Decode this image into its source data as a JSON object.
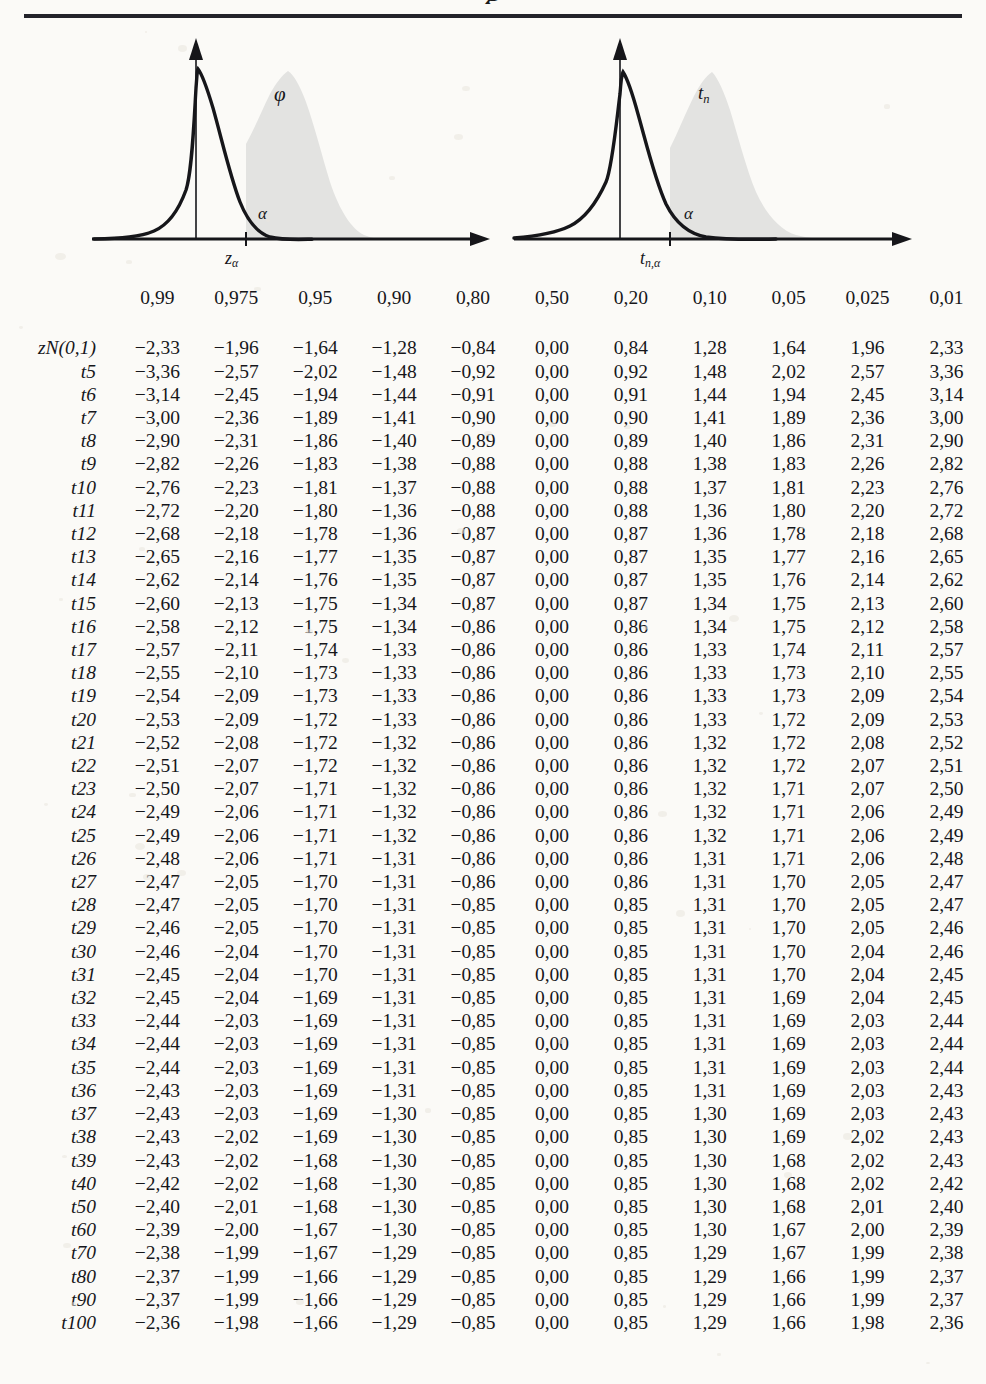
{
  "document": {
    "title_fragment": "g",
    "figures": [
      {
        "name": "standard-normal-density",
        "curve_label": "φ",
        "area_label": "α",
        "x_mark_base": "z",
        "x_mark_sub": "α"
      },
      {
        "name": "t-distribution-density",
        "curve_label_base": "t",
        "curve_label_sub": "n",
        "area_label": "α",
        "x_mark_base": "t",
        "x_mark_sub": "n,α"
      }
    ]
  },
  "chart_data": {
    "type": "table",
    "row_header_label": "",
    "columns": [
      "0,99",
      "0,975",
      "0,95",
      "0,90",
      "0,80",
      "0,50",
      "0,20",
      "0,10",
      "0,05",
      "0,025",
      "0,01"
    ],
    "rows": [
      {
        "base": "z",
        "sub": "N(0,1)",
        "calligraphic": true,
        "values": [
          "−2,33",
          "−1,96",
          "−1,64",
          "−1,28",
          "−0,84",
          "0,00",
          "0,84",
          "1,28",
          "1,64",
          "1,96",
          "2,33"
        ]
      },
      {
        "base": "t",
        "sub": "5",
        "values": [
          "−3,36",
          "−2,57",
          "−2,02",
          "−1,48",
          "−0,92",
          "0,00",
          "0,92",
          "1,48",
          "2,02",
          "2,57",
          "3,36"
        ]
      },
      {
        "base": "t",
        "sub": "6",
        "values": [
          "−3,14",
          "−2,45",
          "−1,94",
          "−1,44",
          "−0,91",
          "0,00",
          "0,91",
          "1,44",
          "1,94",
          "2,45",
          "3,14"
        ]
      },
      {
        "base": "t",
        "sub": "7",
        "values": [
          "−3,00",
          "−2,36",
          "−1,89",
          "−1,41",
          "−0,90",
          "0,00",
          "0,90",
          "1,41",
          "1,89",
          "2,36",
          "3,00"
        ]
      },
      {
        "base": "t",
        "sub": "8",
        "values": [
          "−2,90",
          "−2,31",
          "−1,86",
          "−1,40",
          "−0,89",
          "0,00",
          "0,89",
          "1,40",
          "1,86",
          "2,31",
          "2,90"
        ]
      },
      {
        "base": "t",
        "sub": "9",
        "values": [
          "−2,82",
          "−2,26",
          "−1,83",
          "−1,38",
          "−0,88",
          "0,00",
          "0,88",
          "1,38",
          "1,83",
          "2,26",
          "2,82"
        ]
      },
      {
        "base": "t",
        "sub": "10",
        "values": [
          "−2,76",
          "−2,23",
          "−1,81",
          "−1,37",
          "−0,88",
          "0,00",
          "0,88",
          "1,37",
          "1,81",
          "2,23",
          "2,76"
        ]
      },
      {
        "base": "t",
        "sub": "11",
        "values": [
          "−2,72",
          "−2,20",
          "−1,80",
          "−1,36",
          "−0,88",
          "0,00",
          "0,88",
          "1,36",
          "1,80",
          "2,20",
          "2,72"
        ]
      },
      {
        "base": "t",
        "sub": "12",
        "values": [
          "−2,68",
          "−2,18",
          "−1,78",
          "−1,36",
          "−0,87",
          "0,00",
          "0,87",
          "1,36",
          "1,78",
          "2,18",
          "2,68"
        ]
      },
      {
        "base": "t",
        "sub": "13",
        "values": [
          "−2,65",
          "−2,16",
          "−1,77",
          "−1,35",
          "−0,87",
          "0,00",
          "0,87",
          "1,35",
          "1,77",
          "2,16",
          "2,65"
        ]
      },
      {
        "base": "t",
        "sub": "14",
        "values": [
          "−2,62",
          "−2,14",
          "−1,76",
          "−1,35",
          "−0,87",
          "0,00",
          "0,87",
          "1,35",
          "1,76",
          "2,14",
          "2,62"
        ]
      },
      {
        "base": "t",
        "sub": "15",
        "values": [
          "−2,60",
          "−2,13",
          "−1,75",
          "−1,34",
          "−0,87",
          "0,00",
          "0,87",
          "1,34",
          "1,75",
          "2,13",
          "2,60"
        ]
      },
      {
        "base": "t",
        "sub": "16",
        "values": [
          "−2,58",
          "−2,12",
          "−1,75",
          "−1,34",
          "−0,86",
          "0,00",
          "0,86",
          "1,34",
          "1,75",
          "2,12",
          "2,58"
        ]
      },
      {
        "base": "t",
        "sub": "17",
        "values": [
          "−2,57",
          "−2,11",
          "−1,74",
          "−1,33",
          "−0,86",
          "0,00",
          "0,86",
          "1,33",
          "1,74",
          "2,11",
          "2,57"
        ]
      },
      {
        "base": "t",
        "sub": "18",
        "values": [
          "−2,55",
          "−2,10",
          "−1,73",
          "−1,33",
          "−0,86",
          "0,00",
          "0,86",
          "1,33",
          "1,73",
          "2,10",
          "2,55"
        ]
      },
      {
        "base": "t",
        "sub": "19",
        "values": [
          "−2,54",
          "−2,09",
          "−1,73",
          "−1,33",
          "−0,86",
          "0,00",
          "0,86",
          "1,33",
          "1,73",
          "2,09",
          "2,54"
        ]
      },
      {
        "base": "t",
        "sub": "20",
        "values": [
          "−2,53",
          "−2,09",
          "−1,72",
          "−1,33",
          "−0,86",
          "0,00",
          "0,86",
          "1,33",
          "1,72",
          "2,09",
          "2,53"
        ]
      },
      {
        "base": "t",
        "sub": "21",
        "values": [
          "−2,52",
          "−2,08",
          "−1,72",
          "−1,32",
          "−0,86",
          "0,00",
          "0,86",
          "1,32",
          "1,72",
          "2,08",
          "2,52"
        ]
      },
      {
        "base": "t",
        "sub": "22",
        "values": [
          "−2,51",
          "−2,07",
          "−1,72",
          "−1,32",
          "−0,86",
          "0,00",
          "0,86",
          "1,32",
          "1,72",
          "2,07",
          "2,51"
        ]
      },
      {
        "base": "t",
        "sub": "23",
        "values": [
          "−2,50",
          "−2,07",
          "−1,71",
          "−1,32",
          "−0,86",
          "0,00",
          "0,86",
          "1,32",
          "1,71",
          "2,07",
          "2,50"
        ]
      },
      {
        "base": "t",
        "sub": "24",
        "values": [
          "−2,49",
          "−2,06",
          "−1,71",
          "−1,32",
          "−0,86",
          "0,00",
          "0,86",
          "1,32",
          "1,71",
          "2,06",
          "2,49"
        ]
      },
      {
        "base": "t",
        "sub": "25",
        "values": [
          "−2,49",
          "−2,06",
          "−1,71",
          "−1,32",
          "−0,86",
          "0,00",
          "0,86",
          "1,32",
          "1,71",
          "2,06",
          "2,49"
        ]
      },
      {
        "base": "t",
        "sub": "26",
        "values": [
          "−2,48",
          "−2,06",
          "−1,71",
          "−1,31",
          "−0,86",
          "0,00",
          "0,86",
          "1,31",
          "1,71",
          "2,06",
          "2,48"
        ]
      },
      {
        "base": "t",
        "sub": "27",
        "values": [
          "−2,47",
          "−2,05",
          "−1,70",
          "−1,31",
          "−0,86",
          "0,00",
          "0,86",
          "1,31",
          "1,70",
          "2,05",
          "2,47"
        ]
      },
      {
        "base": "t",
        "sub": "28",
        "values": [
          "−2,47",
          "−2,05",
          "−1,70",
          "−1,31",
          "−0,85",
          "0,00",
          "0,85",
          "1,31",
          "1,70",
          "2,05",
          "2,47"
        ]
      },
      {
        "base": "t",
        "sub": "29",
        "values": [
          "−2,46",
          "−2,05",
          "−1,70",
          "−1,31",
          "−0,85",
          "0,00",
          "0,85",
          "1,31",
          "1,70",
          "2,05",
          "2,46"
        ]
      },
      {
        "base": "t",
        "sub": "30",
        "values": [
          "−2,46",
          "−2,04",
          "−1,70",
          "−1,31",
          "−0,85",
          "0,00",
          "0,85",
          "1,31",
          "1,70",
          "2,04",
          "2,46"
        ]
      },
      {
        "base": "t",
        "sub": "31",
        "values": [
          "−2,45",
          "−2,04",
          "−1,70",
          "−1,31",
          "−0,85",
          "0,00",
          "0,85",
          "1,31",
          "1,70",
          "2,04",
          "2,45"
        ]
      },
      {
        "base": "t",
        "sub": "32",
        "values": [
          "−2,45",
          "−2,04",
          "−1,69",
          "−1,31",
          "−0,85",
          "0,00",
          "0,85",
          "1,31",
          "1,69",
          "2,04",
          "2,45"
        ]
      },
      {
        "base": "t",
        "sub": "33",
        "values": [
          "−2,44",
          "−2,03",
          "−1,69",
          "−1,31",
          "−0,85",
          "0,00",
          "0,85",
          "1,31",
          "1,69",
          "2,03",
          "2,44"
        ]
      },
      {
        "base": "t",
        "sub": "34",
        "values": [
          "−2,44",
          "−2,03",
          "−1,69",
          "−1,31",
          "−0,85",
          "0,00",
          "0,85",
          "1,31",
          "1,69",
          "2,03",
          "2,44"
        ]
      },
      {
        "base": "t",
        "sub": "35",
        "values": [
          "−2,44",
          "−2,03",
          "−1,69",
          "−1,31",
          "−0,85",
          "0,00",
          "0,85",
          "1,31",
          "1,69",
          "2,03",
          "2,44"
        ]
      },
      {
        "base": "t",
        "sub": "36",
        "values": [
          "−2,43",
          "−2,03",
          "−1,69",
          "−1,31",
          "−0,85",
          "0,00",
          "0,85",
          "1,31",
          "1,69",
          "2,03",
          "2,43"
        ]
      },
      {
        "base": "t",
        "sub": "37",
        "values": [
          "−2,43",
          "−2,03",
          "−1,69",
          "−1,30",
          "−0,85",
          "0,00",
          "0,85",
          "1,30",
          "1,69",
          "2,03",
          "2,43"
        ]
      },
      {
        "base": "t",
        "sub": "38",
        "values": [
          "−2,43",
          "−2,02",
          "−1,69",
          "−1,30",
          "−0,85",
          "0,00",
          "0,85",
          "1,30",
          "1,69",
          "2,02",
          "2,43"
        ]
      },
      {
        "base": "t",
        "sub": "39",
        "values": [
          "−2,43",
          "−2,02",
          "−1,68",
          "−1,30",
          "−0,85",
          "0,00",
          "0,85",
          "1,30",
          "1,68",
          "2,02",
          "2,43"
        ]
      },
      {
        "base": "t",
        "sub": "40",
        "values": [
          "−2,42",
          "−2,02",
          "−1,68",
          "−1,30",
          "−0,85",
          "0,00",
          "0,85",
          "1,30",
          "1,68",
          "2,02",
          "2,42"
        ]
      },
      {
        "base": "t",
        "sub": "50",
        "values": [
          "−2,40",
          "−2,01",
          "−1,68",
          "−1,30",
          "−0,85",
          "0,00",
          "0,85",
          "1,30",
          "1,68",
          "2,01",
          "2,40"
        ]
      },
      {
        "base": "t",
        "sub": "60",
        "values": [
          "−2,39",
          "−2,00",
          "−1,67",
          "−1,30",
          "−0,85",
          "0,00",
          "0,85",
          "1,30",
          "1,67",
          "2,00",
          "2,39"
        ]
      },
      {
        "base": "t",
        "sub": "70",
        "values": [
          "−2,38",
          "−1,99",
          "−1,67",
          "−1,29",
          "−0,85",
          "0,00",
          "0,85",
          "1,29",
          "1,67",
          "1,99",
          "2,38"
        ]
      },
      {
        "base": "t",
        "sub": "80",
        "values": [
          "−2,37",
          "−1,99",
          "−1,66",
          "−1,29",
          "−0,85",
          "0,00",
          "0,85",
          "1,29",
          "1,66",
          "1,99",
          "2,37"
        ]
      },
      {
        "base": "t",
        "sub": "90",
        "values": [
          "−2,37",
          "−1,99",
          "−1,66",
          "−1,29",
          "−0,85",
          "0,00",
          "0,85",
          "1,29",
          "1,66",
          "1,99",
          "2,37"
        ]
      },
      {
        "base": "t",
        "sub": "100",
        "values": [
          "−2,36",
          "−1,98",
          "−1,66",
          "−1,29",
          "−0,85",
          "0,00",
          "0,85",
          "1,29",
          "1,66",
          "1,98",
          "2,36"
        ]
      }
    ]
  },
  "colors": {
    "ink": "#16161a",
    "rule": "#23232a",
    "paper": "#fbfaf7",
    "shaded_area": "#e3e3e1"
  }
}
